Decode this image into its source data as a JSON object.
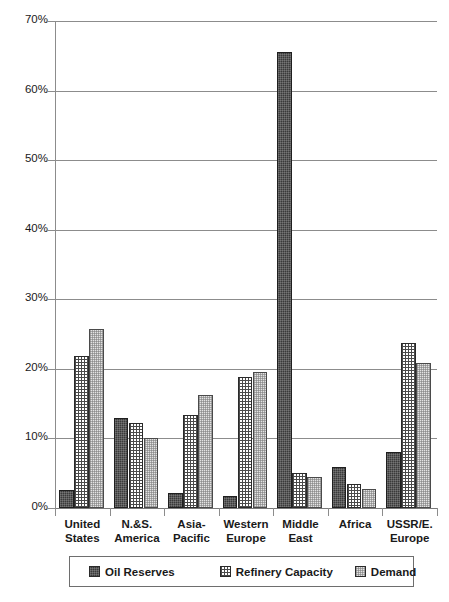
{
  "chart_data": {
    "type": "bar",
    "title": "",
    "xlabel": "",
    "ylabel": "",
    "ylim": [
      0,
      70
    ],
    "ytick_values": [
      0,
      10,
      20,
      30,
      40,
      50,
      60,
      70
    ],
    "ytick_labels": [
      "0%",
      "10%",
      "20%",
      "30%",
      "40%",
      "50%",
      "60%",
      "70%"
    ],
    "grid": "horizontal",
    "legend_position": "below-axis",
    "categories": [
      "United States",
      "N.&S. America",
      "Asia-Pacific",
      "Western Europe",
      "Middle East",
      "Africa",
      "USSR/E. Europe"
    ],
    "category_label_lines": [
      [
        "United",
        "States"
      ],
      [
        "N.&S.",
        "America"
      ],
      [
        "Asia-",
        "Pacific"
      ],
      [
        "Western",
        "Europe"
      ],
      [
        "Middle",
        "East"
      ],
      [
        "Africa",
        ""
      ],
      [
        "USSR/E.",
        "Europe"
      ]
    ],
    "series": [
      {
        "name": "Oil Reserves",
        "pattern": "dark-solid",
        "color": "#3a3a3a",
        "values": [
          2.6,
          13.0,
          2.2,
          1.7,
          65.6,
          5.9,
          8.1
        ]
      },
      {
        "name": "Refinery Capacity",
        "pattern": "crosshatch",
        "color": "#ffffff",
        "values": [
          21.9,
          12.2,
          13.4,
          18.9,
          5.0,
          3.5,
          23.7
        ]
      },
      {
        "name": "Demand",
        "pattern": "light-checker",
        "color": "#e3e3e3",
        "values": [
          25.7,
          10.1,
          16.3,
          19.5,
          4.4,
          2.7,
          20.8
        ]
      }
    ]
  },
  "legend": {
    "items": [
      {
        "label": "Oil Reserves"
      },
      {
        "label": "Refinery Capacity"
      },
      {
        "label": "Demand"
      }
    ]
  }
}
